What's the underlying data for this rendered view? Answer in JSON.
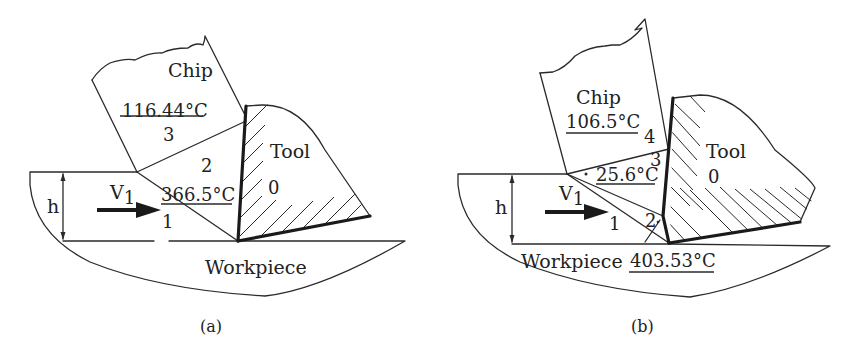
{
  "panels": [
    {
      "id": "a",
      "caption": "(a)",
      "labels": {
        "chip": "Chip",
        "tool": "Tool",
        "workpiece": "Workpiece",
        "thickness": "h",
        "velocity": "V",
        "velocity_sub": "1"
      },
      "zones": [
        {
          "id": "0",
          "label": "0"
        },
        {
          "id": "1",
          "label": "1"
        },
        {
          "id": "2",
          "label": "2",
          "temperature": "366.5°C"
        },
        {
          "id": "3",
          "label": "3",
          "temperature": "116.44°C"
        }
      ]
    },
    {
      "id": "b",
      "caption": "(b)",
      "labels": {
        "chip": "Chip",
        "tool": "Tool",
        "workpiece": "Workpiece",
        "thickness": "h",
        "velocity": "V",
        "velocity_sub": "1"
      },
      "zones": [
        {
          "id": "0",
          "label": "0"
        },
        {
          "id": "1",
          "label": "1"
        },
        {
          "id": "2",
          "label": "2",
          "temperature": "403.53°C"
        },
        {
          "id": "3",
          "label": "3",
          "temperature": "25.6°C"
        },
        {
          "id": "4",
          "label": "4",
          "temperature": "106.5°C"
        }
      ]
    }
  ],
  "colors": {
    "line": "#2a2a2a",
    "background": "#ffffff"
  }
}
